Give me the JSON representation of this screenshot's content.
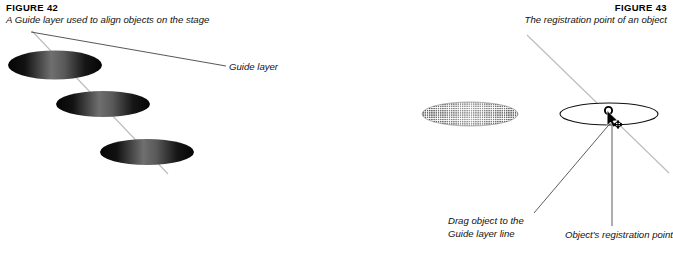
{
  "figures": [
    {
      "label": "FIGURE 42",
      "caption": "A Guide layer used to align objects on the stage",
      "callouts": [
        {
          "name": "guide-layer",
          "text": "Guide layer"
        }
      ]
    },
    {
      "label": "FIGURE 43",
      "caption": "The registration point of an object",
      "callouts": [
        {
          "name": "drag-object",
          "line1": "Drag object to the",
          "line2": "Guide layer line"
        },
        {
          "name": "registration-point",
          "text": "Object's registration point"
        }
      ]
    }
  ],
  "colors": {
    "page_background": "#ffffff",
    "text": "#111111",
    "heading": "#000000",
    "leader_line": "#3b3b3b",
    "guide_line": "#b9b9b9",
    "ellipse_outline": "#1a1a1a",
    "ellipse_dark": "#0d0d0d",
    "ellipse_mid": "#6b6b6b",
    "ellipse_light": "#8d8d8d",
    "halftone_dot": "#3a3a3a"
  },
  "art": {
    "left_figure": {
      "guide_line": {
        "x1": 32,
        "y1": 31,
        "x2": 168,
        "y2": 174
      },
      "leader_line": {
        "x1": 31,
        "y1": 32,
        "x2": 225,
        "y2": 66
      },
      "ellipses": [
        {
          "cx": 55,
          "cy": 65,
          "rx": 47,
          "ry": 14
        },
        {
          "cx": 103,
          "cy": 104,
          "rx": 47,
          "ry": 13
        },
        {
          "cx": 147,
          "cy": 152,
          "rx": 47,
          "ry": 13
        }
      ]
    },
    "right_figure": {
      "guide_line": {
        "x1": 527,
        "y1": 35,
        "x2": 669,
        "y2": 173
      },
      "halftone_ellipse": {
        "cx": 470,
        "cy": 114,
        "rx": 48,
        "ry": 12
      },
      "outline_ellipse": {
        "cx": 609,
        "cy": 114,
        "rx": 49,
        "ry": 11
      },
      "registration_point": {
        "x": 613,
        "y": 116
      },
      "leader_drag": {
        "x1": 534,
        "y1": 214,
        "x2": 612,
        "y2": 121
      },
      "leader_registration": {
        "x1": 612,
        "y1": 228,
        "x2": 612,
        "y2": 123
      }
    }
  }
}
